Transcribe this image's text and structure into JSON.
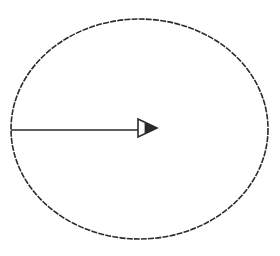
{
  "diagram": {
    "type": "circle-with-radius-arrow",
    "background": "#ffffff",
    "stroke_color": "#2a2a2a",
    "ellipse": {
      "cx": 139.5,
      "cy": 129,
      "rx": 128.5,
      "ry": 110
    },
    "radius_arrow": {
      "x1": 11,
      "y1": 130,
      "x2": 138,
      "y2": 130,
      "head": {
        "base_x": 138,
        "tip_x": 157,
        "top_y": 119,
        "bottom_y": 137,
        "tip_y": 128
      },
      "direction": "right"
    },
    "labels": []
  }
}
